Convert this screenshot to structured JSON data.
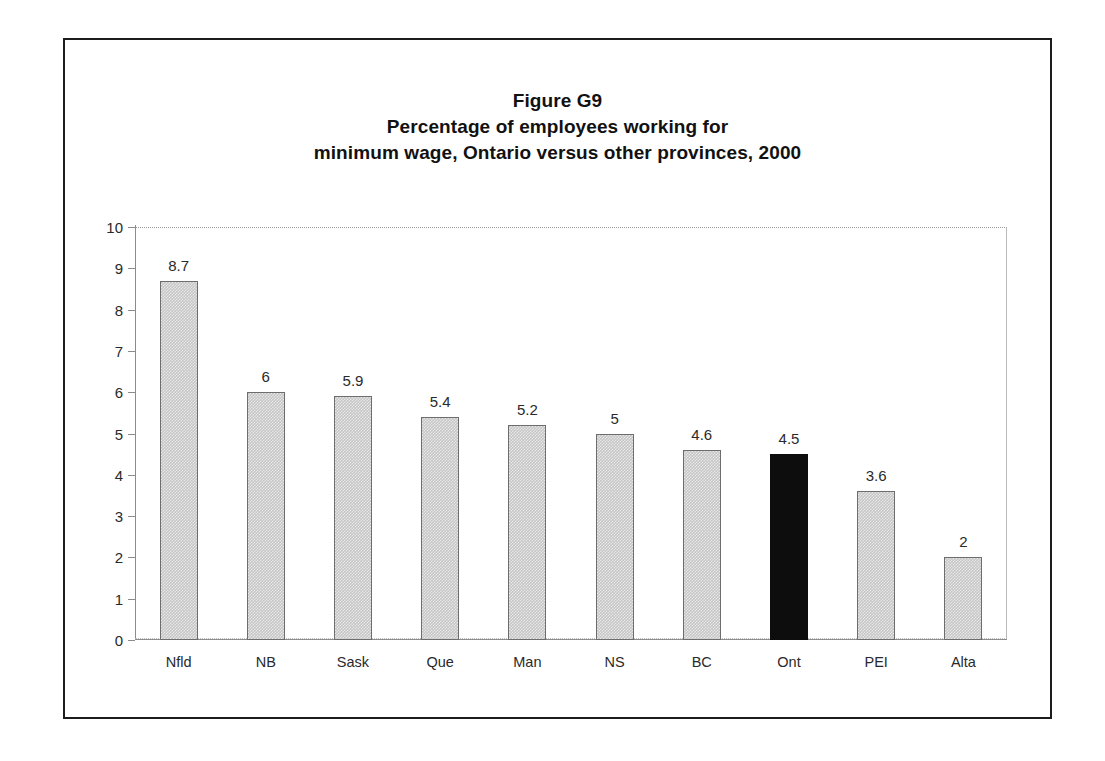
{
  "figure": {
    "title_lines": [
      "Figure G9",
      "Percentage of employees working for",
      "minimum wage, Ontario versus other provinces, 2000"
    ],
    "border_color": "#1c1c1c",
    "background": "#ffffff"
  },
  "chart_data": {
    "type": "bar",
    "xlabel": "",
    "ylabel": "",
    "ylim": [
      0,
      10
    ],
    "ytick_step": 1,
    "yticks": [
      "10",
      "9",
      "8",
      "7",
      "6",
      "5",
      "4",
      "3",
      "2",
      "1",
      "0"
    ],
    "grid": false,
    "legend": null,
    "categories": [
      "Nfld",
      "NB",
      "Sask",
      "Que",
      "Man",
      "NS",
      "BC",
      "Ont",
      "PEI",
      "Alta"
    ],
    "values": [
      8.7,
      6,
      5.9,
      5.4,
      5.2,
      5,
      4.6,
      4.5,
      3.6,
      2
    ],
    "value_labels": [
      "8.7",
      "6",
      "5.9",
      "5.4",
      "5.2",
      "5",
      "4.6",
      "4.5",
      "3.6",
      "2"
    ],
    "highlight_category": "Ont",
    "bar_color": "#c6c6c6",
    "bar_border_color": "#6d6d6d",
    "highlight_color": "#0d0d0d"
  }
}
